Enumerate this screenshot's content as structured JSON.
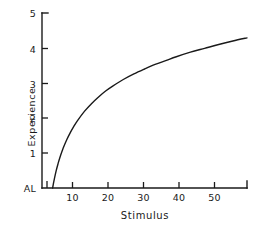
{
  "chart_data": {
    "type": "line",
    "title": "",
    "xlabel": "Stimulus",
    "ylabel": "Experience",
    "xlim": [
      0,
      58
    ],
    "ylim": [
      0,
      5
    ],
    "grid": false,
    "legend": null,
    "x_ticks": [
      {
        "value": 10,
        "label": "10"
      },
      {
        "value": 20,
        "label": "20"
      },
      {
        "value": 30,
        "label": "30"
      },
      {
        "value": 40,
        "label": "40"
      },
      {
        "value": 50,
        "label": "50"
      }
    ],
    "y_ticks": [
      {
        "value": 0,
        "label": "AL"
      },
      {
        "value": 1,
        "label": "1"
      },
      {
        "value": 2,
        "label": "2"
      },
      {
        "value": 3,
        "label": "3"
      },
      {
        "value": 4,
        "label": "4"
      },
      {
        "value": 5,
        "label": "5"
      }
    ],
    "series": [
      {
        "name": "Fechner logarithmic function",
        "color": "#1a1a1a",
        "x": [
          3.0,
          3.2,
          3.5,
          4.0,
          4.5,
          5.0,
          6.0,
          7.0,
          8.0,
          9.0,
          10.0,
          12.0,
          14.0,
          16.0,
          18.0,
          20.0,
          23.0,
          26.0,
          29.0,
          32.0,
          35.0,
          38.0,
          42.0,
          46.0,
          50.0,
          54.0,
          58.0
        ],
        "y": [
          0.0,
          0.11,
          0.26,
          0.49,
          0.68,
          0.85,
          1.14,
          1.38,
          1.58,
          1.76,
          1.92,
          2.19,
          2.41,
          2.6,
          2.77,
          2.91,
          3.1,
          3.26,
          3.4,
          3.53,
          3.64,
          3.75,
          3.88,
          3.99,
          4.1,
          4.2,
          4.29
        ]
      }
    ]
  },
  "axes": {
    "y_axis_title": "Experience",
    "x_axis_title": "Stimulus",
    "y_tick_labels": [
      "5",
      "4",
      "3",
      "2",
      "1",
      "AL"
    ],
    "x_tick_labels": [
      "10",
      "20",
      "30",
      "40",
      "50"
    ]
  },
  "style": {
    "background": "#ffffff",
    "ink": "#1a1a1a",
    "line_width": "1.4"
  }
}
